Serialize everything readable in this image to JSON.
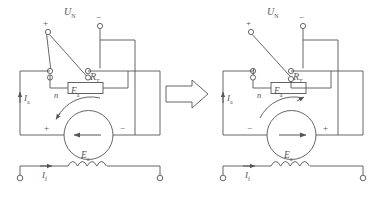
{
  "figure": {
    "type": "electrical-schematic-pair",
    "transition_icon": "right-block-arrow",
    "line_color": "#555555",
    "background": "#ffffff"
  },
  "diagrams": [
    {
      "id": "left",
      "labels": {
        "supply": "U",
        "supply_sub": "N",
        "plus_terminal": "+",
        "minus_terminal": "−",
        "resistor": "R",
        "resistor_sub": "T",
        "armature_current": "I",
        "armature_current_sub": "a",
        "emf": "E",
        "emf_sub": "a",
        "speed": "n",
        "field_current": "I",
        "field_current_sub": "f",
        "field_emf": "E",
        "field_emf_sub": "a",
        "machine_left_sign": "+",
        "machine_right_sign": "−"
      },
      "machine_arrow_direction": "left",
      "rotation_arrow_direction": "counterclockwise",
      "switch_state": "upper-blade-to-plus"
    },
    {
      "id": "right",
      "labels": {
        "supply": "U",
        "supply_sub": "N",
        "plus_terminal": "+",
        "minus_terminal": "−",
        "resistor": "R",
        "resistor_sub": "T",
        "armature_current": "I",
        "armature_current_sub": "a",
        "emf": "E",
        "emf_sub": "a",
        "speed": "n",
        "field_current": "I",
        "field_current_sub": "f",
        "field_emf": "E",
        "field_emf_sub": "a",
        "machine_left_sign": "−",
        "machine_right_sign": "+"
      },
      "machine_arrow_direction": "right",
      "rotation_arrow_direction": "clockwise",
      "switch_state": "blade-to-lower-terminals"
    }
  ]
}
